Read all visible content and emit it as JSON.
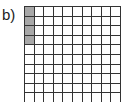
{
  "label": "b)",
  "grid": {
    "rows": 10,
    "cols": 10,
    "shaded_cells": [
      [
        0,
        0
      ],
      [
        1,
        0
      ],
      [
        2,
        0
      ],
      [
        3,
        0
      ]
    ],
    "shaded_count": 4,
    "total_cells": 100,
    "shade_color": "#a8a8a8",
    "line_color": "#333333"
  }
}
